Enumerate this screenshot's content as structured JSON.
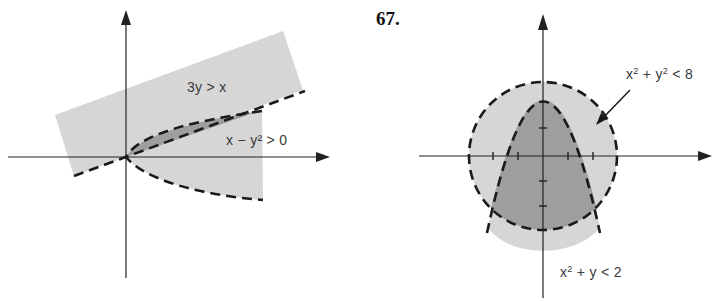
{
  "figure": {
    "left": {
      "regions": [
        {
          "inequality_label": "3y > x",
          "lhs": "3y",
          "op": ">",
          "rhs": "x"
        },
        {
          "inequality_label": "x − y² > 0",
          "lhs_base": "x − y",
          "exponent": "2",
          "op": "> 0"
        }
      ],
      "colors": {
        "light_region": "#d6d6d6",
        "overlap_region": "#9e9e9e",
        "boundary": "#1a1a1a",
        "axis": "#222222"
      }
    },
    "right": {
      "problem_number": "67.",
      "regions": [
        {
          "inequality_label": "x² + y² < 8",
          "part1": "x",
          "exp1": "2",
          "part2": " + y",
          "exp2": "2",
          "part3": " < 8"
        },
        {
          "inequality_label": "x² + y < 2",
          "part1": "x",
          "exp1": "2",
          "part2": " + y < 2"
        }
      ],
      "colors": {
        "light_region": "#d6d6d6",
        "overlap_region": "#9e9e9e",
        "boundary": "#1a1a1a",
        "axis": "#222222"
      }
    }
  }
}
